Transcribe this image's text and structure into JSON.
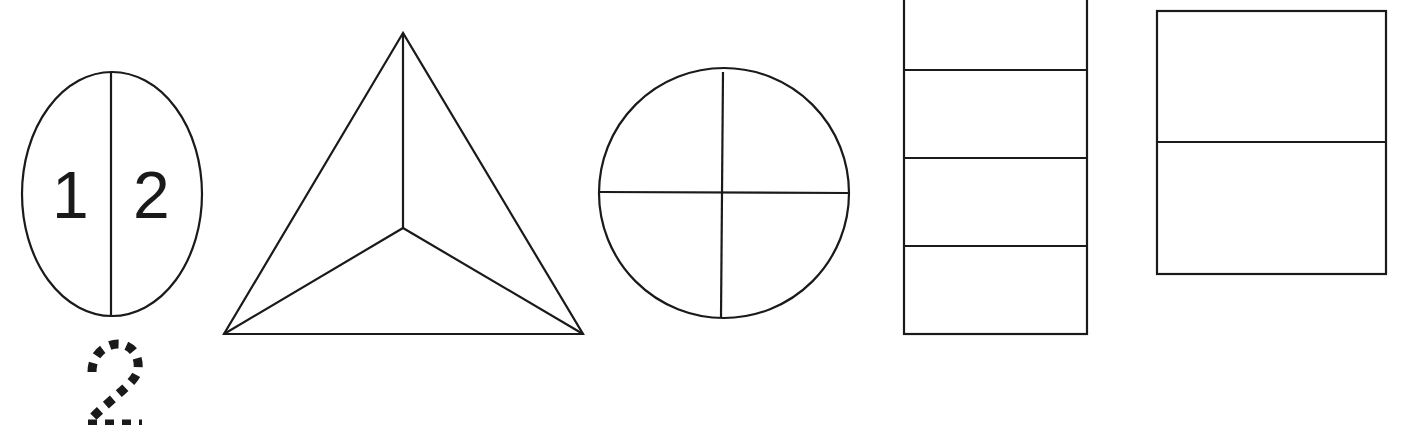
{
  "worksheet": {
    "shapes": [
      {
        "name": "oval",
        "parts": 2,
        "labels": [
          "1",
          "2"
        ]
      },
      {
        "name": "triangle",
        "parts": 3
      },
      {
        "name": "circle",
        "parts": 4
      },
      {
        "name": "tall-rectangle",
        "parts": 4
      },
      {
        "name": "square",
        "parts": 2
      }
    ],
    "trace_number": "2",
    "colors": {
      "ink": "#1a1a1a",
      "paper": "#ffffff"
    }
  }
}
